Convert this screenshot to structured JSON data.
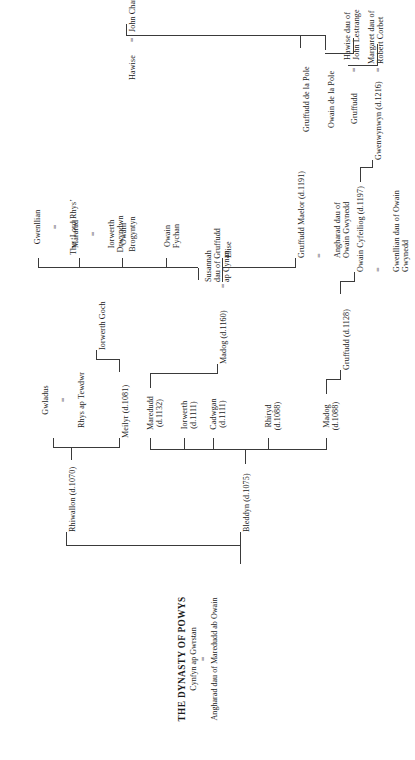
{
  "document": {
    "title": "THE DYNASTY OF POWYS",
    "root": {
      "name": "Cynfyn ap Gwrstan",
      "marriage_symbol": "=",
      "spouse": "Angharad dau of Maredudd ab Owain"
    }
  },
  "generation_1": [
    {
      "id": "bleddyn",
      "name": "Bleddyn (d.1075)"
    },
    {
      "id": "rhiwallon",
      "name": "Rhiwallon (d.1070)"
    }
  ],
  "generation_2": [
    {
      "id": "madog-1088",
      "name": "Madog\n(d.1088)"
    },
    {
      "id": "rhiryd",
      "name": "Rhiryd\n(d.1088)"
    },
    {
      "id": "cadwgan",
      "name": "Cadwgan\n(d.1111)"
    },
    {
      "id": "iorwerth",
      "name": "Iorwerth\n(d.1111)"
    },
    {
      "id": "maredudd",
      "name": "Maredudd\n(d.1132)"
    },
    {
      "id": "meilyr",
      "name": "Meilyr (d.1081)"
    },
    {
      "id": "gwladus",
      "name": "Gwladus",
      "marriage_symbol": "=",
      "spouse": "Rhys ap Tewdwr"
    }
  ],
  "generation_3": [
    {
      "id": "gruffudd-1128",
      "name": "Gruffudd (d.1128)"
    },
    {
      "id": "madog-1160",
      "name": "Madog (d.1160)",
      "marriage_symbol": "=",
      "spouse": "Susannah\ndau of Gruffudd\nap Cynan"
    },
    {
      "id": "iorwerth-goch",
      "name": "Iorwerth Goch"
    }
  ],
  "generation_4": [
    {
      "id": "owain-cyfeiliog",
      "name": "Owain Cyfeiliog (d.1197)",
      "marriage_symbol": "=",
      "spouse": "Gwenllian dau of Owain Gwynedd"
    },
    {
      "id": "gruffudd-maelor",
      "name": "Gruffudd Maelor (d.1191)",
      "marriage_symbol": "=",
      "spouse": "Angharad dau of\nOwain Gwynedd"
    },
    {
      "id": "elise",
      "name": "Elise"
    },
    {
      "id": "owain-fychan",
      "name": "Owain\nFychan"
    },
    {
      "id": "owain-brogyntyn",
      "name": "Owain\nBrogyntyn"
    },
    {
      "id": "mararad",
      "name": "Mararad",
      "marriage_symbol": "=",
      "spouse": "Iorwerth\nDrwyndwn"
    },
    {
      "id": "gwenllian",
      "name": "Gwenllian",
      "marriage_symbol": "=",
      "spouse": "The ‘Lord Rhys’"
    }
  ],
  "generation_5": [
    {
      "id": "gwenwynwyn",
      "name": "Gwenwynwyn (d.1216)",
      "marriage_symbol": "=",
      "spouse": "Margaret dau of\nRobert Corbet"
    }
  ],
  "generation_6": [
    {
      "id": "gruffudd-pole",
      "name": "Gruffudd",
      "marriage_symbol": "=",
      "spouse": "Hawise dau of\nJohn Lestrange"
    }
  ],
  "generation_7": [
    {
      "id": "owain-de-la-pole",
      "name": "Owain de la Pole"
    }
  ],
  "generation_8": [
    {
      "id": "gruffudd-de-la-pole",
      "name": "Gruffudd de la Pole"
    }
  ],
  "generation_9": [
    {
      "id": "hawise-charlton",
      "name": "Hawise",
      "marriage_symbol": "=",
      "spouse": "John Charlton"
    }
  ],
  "colors": {
    "ink": "#1a1a1a",
    "rule": "#3a3a3a",
    "background": "#ffffff"
  }
}
